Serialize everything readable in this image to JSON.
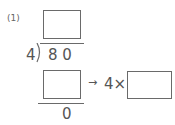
{
  "problem": {
    "label": "(1)",
    "divisor": "4",
    "dividend": "8 0",
    "remainder": "0",
    "arrow": "→",
    "multiplier_expr": "4×",
    "quotient_box": "",
    "product_box": "",
    "multiply_box": ""
  }
}
